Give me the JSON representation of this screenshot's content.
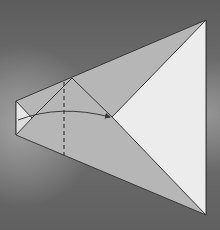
{
  "diagram": {
    "type": "origami-fold-step",
    "background": "cloudy-sky-grayscale",
    "colors": {
      "sky_dark": "#5f5f5f",
      "sky_light": "#9a9a9a",
      "paper_gray": "#b4b4b4",
      "paper_white": "#ececec",
      "line": "#3a3a3a"
    },
    "elements": [
      "paper-shape",
      "valley-fold-dashed-line",
      "fold-direction-arrow",
      "white-flap-triangle"
    ]
  }
}
